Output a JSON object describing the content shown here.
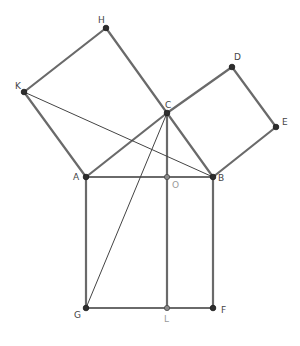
{
  "diagram": {
    "points": {
      "A": {
        "x": 86,
        "y": 177,
        "label": "A",
        "kind": "main"
      },
      "B": {
        "x": 213,
        "y": 177,
        "label": "B",
        "kind": "main"
      },
      "C": {
        "x": 167,
        "y": 113,
        "label": "C",
        "kind": "main"
      },
      "D": {
        "x": 232,
        "y": 67,
        "label": "D",
        "kind": "main"
      },
      "E": {
        "x": 276,
        "y": 127,
        "label": "E",
        "kind": "main"
      },
      "H": {
        "x": 106,
        "y": 28,
        "label": "H",
        "kind": "main"
      },
      "K": {
        "x": 24,
        "y": 92,
        "label": "K",
        "kind": "main"
      },
      "G": {
        "x": 86,
        "y": 308,
        "label": "G",
        "kind": "main"
      },
      "F": {
        "x": 213,
        "y": 308,
        "label": "F",
        "kind": "main"
      },
      "O": {
        "x": 167,
        "y": 177,
        "label": "O",
        "kind": "aux"
      },
      "L": {
        "x": 167,
        "y": 308,
        "label": "L",
        "kind": "aux"
      }
    },
    "thick_segments": [
      [
        "A",
        "B"
      ],
      [
        "A",
        "C"
      ],
      [
        "C",
        "B"
      ],
      [
        "A",
        "K"
      ],
      [
        "K",
        "H"
      ],
      [
        "H",
        "C"
      ],
      [
        "C",
        "D"
      ],
      [
        "D",
        "E"
      ],
      [
        "E",
        "B"
      ],
      [
        "A",
        "G"
      ],
      [
        "G",
        "F"
      ],
      [
        "F",
        "B"
      ],
      [
        "C",
        "L"
      ]
    ],
    "thin_segments": [
      [
        "K",
        "B"
      ],
      [
        "C",
        "G"
      ]
    ],
    "colors": {
      "stroke": "#6a6a6a",
      "thin_stroke": "#444444",
      "point": "#2e2e2e",
      "aux_point": "#8a8a8a",
      "label": "#444444",
      "aux_label": "#9a9a9a"
    }
  }
}
